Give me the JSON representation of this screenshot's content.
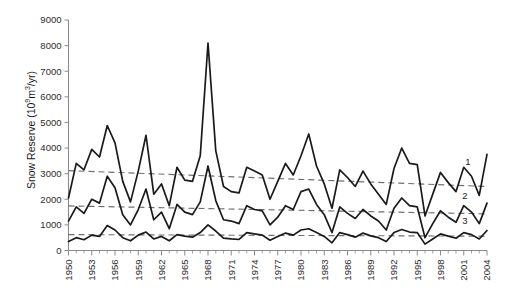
{
  "chart_data": {
    "type": "line",
    "title": "",
    "xlabel": "",
    "ylabel": "Snow Reserve (10⁹m³/yr)",
    "ylabel_parts": {
      "prefix": "Snow Reserve (10",
      "exp1": "9",
      "mid": "m",
      "exp2": "3",
      "suffix": "/yr)"
    },
    "xlim": [
      1950,
      2004
    ],
    "ylim": [
      0,
      9000
    ],
    "y_ticks": [
      0,
      1000,
      2000,
      3000,
      4000,
      5000,
      6000,
      7000,
      8000,
      9000
    ],
    "x_ticks_labeled": [
      1950,
      1953,
      1956,
      1959,
      1962,
      1965,
      1968,
      1971,
      1974,
      1977,
      1980,
      1983,
      1986,
      1989,
      1992,
      1995,
      1998,
      2001,
      2004
    ],
    "x": [
      1950,
      1951,
      1952,
      1953,
      1954,
      1955,
      1956,
      1957,
      1958,
      1959,
      1960,
      1961,
      1962,
      1963,
      1964,
      1965,
      1966,
      1967,
      1968,
      1969,
      1970,
      1971,
      1972,
      1973,
      1974,
      1975,
      1976,
      1977,
      1978,
      1979,
      1980,
      1981,
      1982,
      1983,
      1984,
      1985,
      1986,
      1987,
      1988,
      1989,
      1990,
      1991,
      1992,
      1993,
      1994,
      1995,
      1996,
      1997,
      1998,
      1999,
      2000,
      2001,
      2002,
      2003,
      2004
    ],
    "grid": false,
    "legend_position": "right-inline",
    "series": [
      {
        "name": "1",
        "label": "1",
        "color": "#1a1a1a",
        "values": [
          2050,
          3400,
          3150,
          3950,
          3650,
          4880,
          4200,
          2700,
          1900,
          3100,
          4500,
          2200,
          2600,
          1750,
          3250,
          2750,
          2700,
          3700,
          8100,
          3900,
          2500,
          2300,
          2250,
          3250,
          3100,
          2950,
          2000,
          2700,
          3400,
          2950,
          3700,
          4550,
          3300,
          2600,
          1650,
          3150,
          2850,
          2500,
          3100,
          2600,
          2200,
          1800,
          3200,
          4000,
          3400,
          3350,
          1350,
          2200,
          3050,
          2650,
          2300,
          3250,
          2900,
          2150,
          3750
        ]
      },
      {
        "name": "2",
        "label": "2",
        "color": "#1a1a1a",
        "values": [
          1150,
          1700,
          1450,
          2000,
          1850,
          2900,
          2450,
          1400,
          1000,
          1600,
          2400,
          1200,
          1500,
          850,
          1800,
          1500,
          1400,
          1900,
          3300,
          1950,
          1200,
          1150,
          1050,
          1750,
          1600,
          1550,
          1000,
          1300,
          1750,
          1600,
          2300,
          2400,
          1800,
          1400,
          700,
          1700,
          1450,
          1250,
          1600,
          1350,
          1150,
          800,
          1650,
          2050,
          1750,
          1700,
          500,
          1050,
          1550,
          1300,
          1100,
          1750,
          1500,
          1050,
          1850
        ]
      },
      {
        "name": "3",
        "label": "3",
        "color": "#1a1a1a",
        "values": [
          350,
          500,
          420,
          600,
          550,
          980,
          800,
          500,
          380,
          600,
          720,
          450,
          550,
          380,
          620,
          560,
          520,
          700,
          1000,
          760,
          480,
          450,
          430,
          700,
          650,
          600,
          400,
          550,
          680,
          600,
          800,
          850,
          700,
          550,
          300,
          700,
          620,
          520,
          680,
          570,
          500,
          350,
          700,
          820,
          720,
          700,
          250,
          450,
          650,
          560,
          480,
          700,
          620,
          450,
          780
        ]
      }
    ],
    "trend_lines": [
      {
        "name": "trend-1",
        "for_series": "1",
        "x": [
          1950,
          2004
        ],
        "y": [
          3120,
          2500
        ],
        "style": "dashed",
        "color": "#6f6f6f"
      },
      {
        "name": "trend-2",
        "for_series": "2",
        "x": [
          1950,
          2004
        ],
        "y": [
          1740,
          1430
        ],
        "style": "dashed",
        "color": "#6f6f6f"
      },
      {
        "name": "trend-3",
        "for_series": "3",
        "x": [
          1950,
          2004
        ],
        "y": [
          620,
          560
        ],
        "style": "dashed",
        "color": "#6f6f6f"
      }
    ],
    "series_labels_inline": [
      {
        "text": "1",
        "x": 2001.2,
        "y": 3350
      },
      {
        "text": "2",
        "x": 2000.8,
        "y": 2020
      },
      {
        "text": "3",
        "x": 2000.8,
        "y": 1020
      }
    ]
  }
}
